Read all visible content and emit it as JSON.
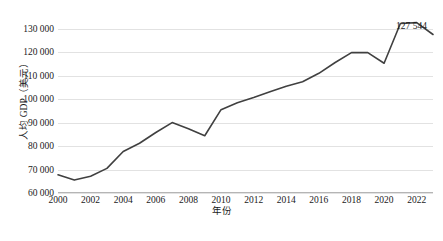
{
  "chart_data": {
    "type": "line",
    "title": "",
    "xlabel": "年份",
    "ylabel": "人均 GDP（美元）",
    "x": [
      2000,
      2001,
      2002,
      2003,
      2004,
      2005,
      2006,
      2007,
      2008,
      2009,
      2010,
      2011,
      2012,
      2013,
      2014,
      2015,
      2016,
      2017,
      2018,
      2019,
      2020,
      2021,
      2022,
      2023
    ],
    "values": [
      67800,
      65500,
      67100,
      70500,
      77700,
      81200,
      85800,
      90000,
      87400,
      84400,
      95500,
      98500,
      100700,
      103100,
      105500,
      107400,
      111000,
      115600,
      119800,
      119800,
      115300,
      132200,
      132600,
      127544
    ],
    "series": [
      {
        "name": "人均 GDP（美元）",
        "values": [
          67800,
          65500,
          67100,
          70500,
          77700,
          81200,
          85800,
          90000,
          87400,
          84400,
          95500,
          98500,
          100700,
          103100,
          105500,
          107400,
          111000,
          115600,
          119800,
          119800,
          115300,
          132200,
          132600,
          127544
        ]
      }
    ],
    "xlim": [
      2000,
      2023
    ],
    "ylim": [
      60000,
      135000
    ],
    "ytick_values": [
      60000,
      70000,
      80000,
      90000,
      100000,
      110000,
      120000,
      130000
    ],
    "ytick_labels": [
      "60 000",
      "70 000",
      "80 000",
      "90 000",
      "100 000",
      "110 000",
      "120 000",
      "130 000"
    ],
    "xtick_values": [
      2000,
      2002,
      2004,
      2006,
      2008,
      2010,
      2012,
      2014,
      2016,
      2018,
      2020,
      2022
    ],
    "xtick_labels": [
      "2000",
      "2002",
      "2004",
      "2006",
      "2008",
      "2010",
      "2012",
      "2014",
      "2016",
      "2018",
      "2020",
      "2022"
    ],
    "grid": "horizontal",
    "legend": "none",
    "line_color": "#404040",
    "line_width": 1.6,
    "annotations": [
      {
        "name": "end-value-label",
        "text": "127 544",
        "x": 2023,
        "y": 127544
      }
    ]
  },
  "figure": {
    "caption": "",
    "background": "#ffffff",
    "grid_color": "#e2e2e2",
    "axis_color": "#b5b5b5",
    "text_color": "#1a1a1a"
  }
}
